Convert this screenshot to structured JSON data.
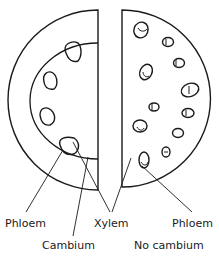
{
  "diagram": {
    "left_section": {
      "description": "Dicot stem half-section with bundles in a ring",
      "labels": {
        "phloem": "Phloem",
        "cambium": "Cambium"
      }
    },
    "right_section": {
      "description": "Monocot stem half-section with scattered bundles",
      "labels": {
        "phloem": "Phloem",
        "no_cambium": "No cambium"
      }
    },
    "shared_labels": {
      "xylem": "Xylem"
    },
    "colors": {
      "stroke": "#1a1a1a",
      "background": "#ffffff"
    }
  }
}
